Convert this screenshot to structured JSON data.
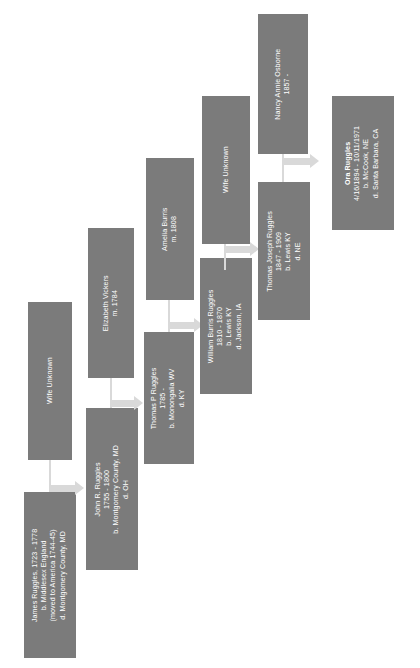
{
  "diagram": {
    "type": "genealogy-chart",
    "orientation": "rotated-90-counterclockwise",
    "box_color": "#7b7b7b",
    "text_color": "#ffffff",
    "connector_color": "#d9d9d9",
    "background_color": "#ffffff"
  },
  "generations": [
    {
      "index": 1,
      "nodes": [
        {
          "id": "wife-unknown-1",
          "lines": [
            "Wife Unknown"
          ],
          "highlight": false
        },
        {
          "id": "james-ruggles",
          "lines": [
            "James Ruggles, 1723 - 1778",
            "b. Middlesex England",
            "(moved to America 1744-45)",
            "d. Montgomery County, MD"
          ],
          "highlight": false
        }
      ]
    },
    {
      "index": 2,
      "nodes": [
        {
          "id": "elizabeth-vickers",
          "lines": [
            "Elizabeth Vickers",
            "m. 1784"
          ],
          "highlight": false
        },
        {
          "id": "john-r-ruggles",
          "lines": [
            "John R. Ruggles",
            "1755 - 1800",
            "b. Montgomery County, MD",
            "d. OH"
          ],
          "highlight": false
        }
      ]
    },
    {
      "index": 3,
      "nodes": [
        {
          "id": "amelia-burris",
          "lines": [
            "Amelia Burris",
            "m. 1808"
          ],
          "highlight": false
        },
        {
          "id": "thomas-p-ruggles",
          "lines": [
            "Thomas P Ruggles",
            "1785 -",
            "b. Monongalia WV",
            "d. KY"
          ],
          "highlight": false
        }
      ]
    },
    {
      "index": 4,
      "nodes": [
        {
          "id": "wife-unknown-2",
          "lines": [
            "Wife Unknown"
          ],
          "highlight": false
        },
        {
          "id": "william-burris-ruggles",
          "lines": [
            "William Burris Ruggles",
            "1810 - 1870",
            "b. Lewis KY",
            "d. Jackson, IA"
          ],
          "highlight": false
        }
      ]
    },
    {
      "index": 5,
      "nodes": [
        {
          "id": "nancy-annie-osborne",
          "lines": [
            "Nancy Annie Osborne",
            "1857 -"
          ],
          "highlight": false
        },
        {
          "id": "thomas-joseph-ruggles",
          "lines": [
            "Thomas Joseph Ruggles",
            "1847 - 1909",
            "b. Lewis KY",
            "d. NE"
          ],
          "highlight": false
        }
      ]
    },
    {
      "index": 6,
      "nodes": [
        {
          "id": "ora-ruggles",
          "lines": [
            "Ora Ruggles",
            "4/16/1894 - 10/11/1971",
            "b. McCook, NE",
            "d. Santa Barbara, CA"
          ],
          "highlight": true
        }
      ]
    }
  ]
}
